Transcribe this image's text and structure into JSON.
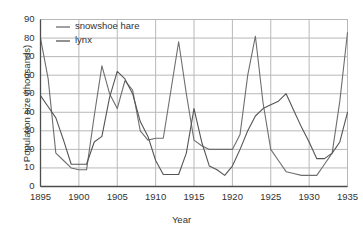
{
  "chart_data": {
    "type": "line",
    "title": "",
    "xlabel": "Year",
    "ylabel": "Population size (thousands)",
    "xlim": [
      1895,
      1935
    ],
    "ylim": [
      0,
      90
    ],
    "xticks": [
      1895,
      1900,
      1905,
      1910,
      1915,
      1920,
      1925,
      1930,
      1935
    ],
    "yticks": [
      0,
      10,
      20,
      30,
      40,
      50,
      60,
      70,
      80,
      90
    ],
    "grid": true,
    "legend_position": "top-left",
    "x": [
      1895,
      1896,
      1897,
      1898,
      1899,
      1900,
      1901,
      1902,
      1903,
      1904,
      1905,
      1906,
      1907,
      1908,
      1909,
      1910,
      1911,
      1912,
      1913,
      1914,
      1915,
      1916,
      1917,
      1918,
      1919,
      1920,
      1921,
      1922,
      1923,
      1924,
      1925,
      1926,
      1927,
      1928,
      1929,
      1930,
      1931,
      1932,
      1933,
      1934,
      1935
    ],
    "series": [
      {
        "name": "snowshoe hare",
        "color": "#6e6e6e",
        "values": [
          80,
          58,
          18,
          14,
          10,
          9,
          9,
          38,
          65,
          50,
          42,
          57,
          52,
          30,
          25,
          26,
          26,
          52,
          78,
          50,
          25,
          22,
          20,
          20,
          20,
          20,
          28,
          60,
          81,
          45,
          20,
          14,
          8,
          7,
          6,
          6,
          6,
          12,
          18,
          46,
          83
        ]
      },
      {
        "name": "lynx",
        "color": "#555555",
        "values": [
          49,
          43,
          37,
          25,
          12,
          12,
          12,
          24,
          27,
          48,
          62,
          58,
          50,
          35,
          27,
          14,
          6.5,
          6.5,
          6.5,
          18,
          42,
          24,
          11,
          9,
          6,
          11,
          20,
          30,
          38,
          42,
          44,
          46,
          50,
          41,
          32,
          24,
          15,
          15,
          18,
          24,
          40
        ]
      }
    ]
  },
  "axes": {
    "y_title": "Population size (thousands)",
    "x_title": "Year",
    "y_tick_labels": [
      "90",
      "80",
      "70",
      "60",
      "50",
      "40",
      "30",
      "20",
      "10",
      "0"
    ],
    "x_tick_labels": [
      "1895",
      "1900",
      "1905",
      "1910",
      "1915",
      "1920",
      "1925",
      "1930",
      "1935"
    ]
  },
  "legend": {
    "items": [
      {
        "label": "snowshoe hare",
        "color": "#6e6e6e"
      },
      {
        "label": "lynx",
        "color": "#555555"
      }
    ]
  },
  "colors": {
    "axis": "#4d4d4d",
    "grid": "#b8b8b8",
    "text": "#333333",
    "background": "#ffffff"
  }
}
